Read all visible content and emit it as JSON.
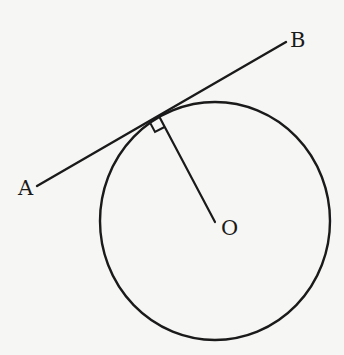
{
  "diagram": {
    "background": "#f6f6f4",
    "stroke": "#1a1a1a",
    "labels": {
      "A": "A",
      "B": "B",
      "O": "O"
    },
    "points": {
      "A": [
        37,
        186
      ],
      "B": [
        286,
        42
      ],
      "O": [
        215,
        222
      ],
      "tangent_point": [
        160,
        118
      ]
    },
    "circle": {
      "cx": 215,
      "cy": 221,
      "rx": 115,
      "ry": 119
    },
    "right_angle_marker": true
  }
}
